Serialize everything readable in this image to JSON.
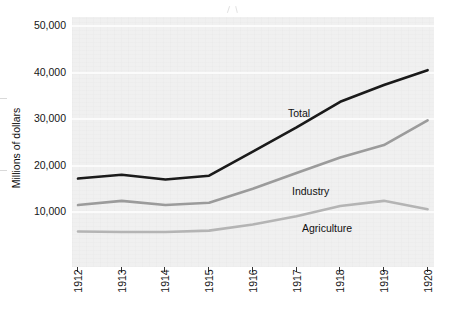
{
  "chart_data": {
    "type": "line",
    "title": "",
    "xlabel": "",
    "ylabel": "Millions of dollars",
    "x": [
      1912,
      1913,
      1914,
      1915,
      1916,
      1917,
      1918,
      1919,
      1920
    ],
    "xtick_labels": [
      "1912",
      "1913",
      "1914",
      "1915",
      "1916",
      "1917",
      "1918",
      "1919",
      "1920"
    ],
    "ytick_labels": [
      "10,000",
      "20,000",
      "30,000",
      "40,000",
      "50,000"
    ],
    "ytick_values": [
      10000,
      20000,
      30000,
      40000,
      50000
    ],
    "ylim": [
      0,
      52000
    ],
    "xlim": [
      1912,
      1920
    ],
    "grid": true,
    "legend_position": "inline-annotations",
    "series": [
      {
        "name": "Total",
        "color": "#1a1a1a",
        "values": [
          17200,
          18000,
          17000,
          17800,
          23000,
          28200,
          33700,
          37300,
          40500
        ]
      },
      {
        "name": "Industry",
        "color": "#9b9b9b",
        "values": [
          11500,
          12400,
          11500,
          12000,
          15000,
          18400,
          21700,
          24400,
          29700
        ]
      },
      {
        "name": "Agriculture",
        "color": "#b4b4b4",
        "values": [
          5800,
          5700,
          5700,
          6000,
          7300,
          9100,
          11300,
          12400,
          10600
        ]
      }
    ],
    "annotations": [
      {
        "text": "Total",
        "x_px": 288,
        "y_px": 107
      },
      {
        "text": "Industry",
        "x_px": 292,
        "y_px": 185
      },
      {
        "text": "Agriculture",
        "x_px": 302,
        "y_px": 222
      }
    ]
  }
}
